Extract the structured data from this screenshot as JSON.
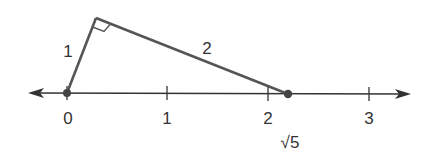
{
  "diagram": {
    "title": "",
    "number_line": {
      "ticks": [
        {
          "value": 0,
          "label": "0"
        },
        {
          "value": 1,
          "label": "1"
        },
        {
          "value": 2,
          "label": "2"
        },
        {
          "value": 3,
          "label": "3"
        }
      ],
      "point_label": "√5"
    },
    "triangle": {
      "leg_short_label": "1",
      "leg_long_label": "2",
      "right_angle": true
    },
    "colors": {
      "line": "#555555",
      "axis": "#333333",
      "text": "#333333"
    }
  }
}
